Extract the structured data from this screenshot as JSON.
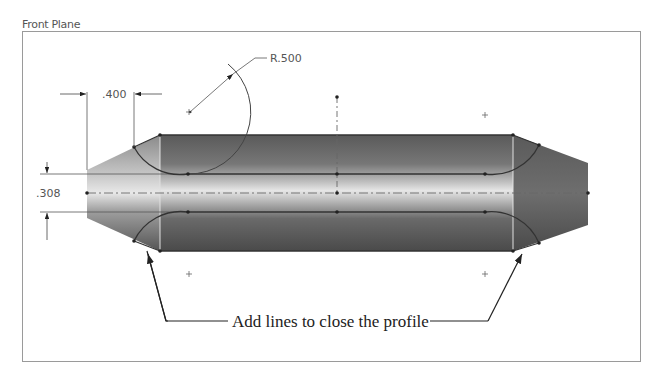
{
  "sketch": {
    "plane_label": "Front Plane",
    "dimensions": {
      "length": ".400",
      "radius": "R.500",
      "height": ".308"
    },
    "callout": "Add lines to close the profile"
  },
  "colors": {
    "body_dark": "#4a4a4a",
    "body_light": "#d8d8d8",
    "sketch_line": "#333333",
    "frame": "#9a9a9a"
  }
}
